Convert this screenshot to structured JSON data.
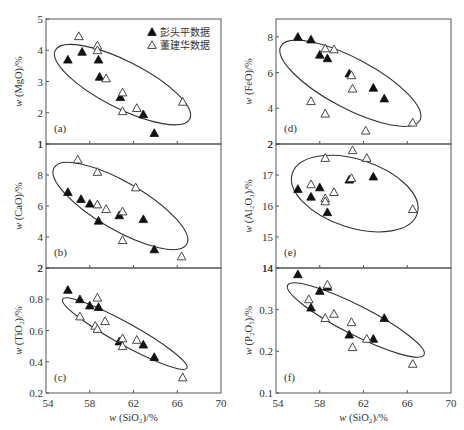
{
  "chart_data": [
    {
      "id": "a",
      "type": "scatter",
      "panel_label": "(a)",
      "ylabel": "w(MgO)/%",
      "xlabel": "",
      "xlim": [
        54,
        70
      ],
      "ylim": [
        1,
        5
      ],
      "yticks": [
        1,
        2,
        3,
        4,
        5
      ],
      "ytick_labels": [
        "1",
        "2",
        "3",
        "4",
        "5"
      ],
      "xticks": [
        54,
        58,
        62,
        66,
        70
      ],
      "show_xtick_labels": false,
      "legend": [
        {
          "name": "彭头平数据",
          "marker": "filled-triangle"
        },
        {
          "name": "董建华数据",
          "marker": "open-triangle"
        }
      ],
      "series": [
        {
          "name": "彭头平数据",
          "marker": "filled-triangle",
          "x": [
            56.0,
            57.3,
            58.9,
            58.8,
            60.8,
            62.9,
            63.9
          ],
          "y": [
            3.7,
            3.95,
            3.15,
            3.7,
            2.5,
            1.95,
            1.35
          ]
        },
        {
          "name": "董建华数据",
          "marker": "open-triangle",
          "x": [
            57.0,
            58.7,
            58.7,
            59.5,
            61.0,
            61.0,
            62.3,
            66.5
          ],
          "y": [
            4.45,
            4.15,
            4.0,
            3.1,
            2.65,
            2.05,
            2.15,
            2.35
          ]
        }
      ],
      "ellipse": {
        "cx": 61.0,
        "cy": 2.9,
        "rx": 6.9,
        "ry": 0.75,
        "angle": 27
      }
    },
    {
      "id": "b",
      "type": "scatter",
      "panel_label": "(b)",
      "ylabel": "w(CaO)/%",
      "xlabel": "",
      "xlim": [
        54,
        70
      ],
      "ylim": [
        2,
        10
      ],
      "yticks": [
        2,
        4,
        6,
        8,
        10
      ],
      "ytick_labels": [
        "2",
        "4",
        "6",
        "8",
        "1"
      ],
      "xticks": [
        54,
        58,
        62,
        66,
        70
      ],
      "show_xtick_labels": false,
      "series": [
        {
          "name": "彭头平数据",
          "marker": "filled-triangle",
          "x": [
            56.0,
            57.2,
            58.0,
            58.8,
            60.7,
            62.9,
            63.9
          ],
          "y": [
            6.9,
            6.45,
            6.15,
            5.05,
            5.4,
            5.15,
            3.2
          ]
        },
        {
          "name": "董建华数据",
          "marker": "open-triangle",
          "x": [
            56.9,
            58.7,
            58.7,
            59.5,
            61.0,
            61.0,
            62.2,
            66.4
          ],
          "y": [
            9.0,
            8.2,
            6.1,
            5.8,
            5.65,
            3.8,
            7.2,
            2.75
          ]
        }
      ],
      "ellipse": {
        "cx": 60.8,
        "cy": 6.0,
        "rx": 7.0,
        "ry": 1.55,
        "angle": 30
      }
    },
    {
      "id": "c",
      "type": "scatter",
      "panel_label": "(c)",
      "ylabel": "w(TiO₂)/%",
      "xlabel": "w(SiO₂)/%",
      "xlim": [
        54,
        70
      ],
      "ylim": [
        0.2,
        1.0
      ],
      "yticks": [
        0.2,
        0.4,
        0.6,
        0.8,
        1.0
      ],
      "ytick_labels": [
        "0.2",
        "0.4",
        "0.6",
        "0.8",
        "2"
      ],
      "xticks": [
        54,
        58,
        62,
        66,
        70
      ],
      "xtick_labels": [
        "54",
        "58",
        "62",
        "66",
        "70"
      ],
      "show_xtick_labels": true,
      "series": [
        {
          "name": "彭头平数据",
          "marker": "filled-triangle",
          "x": [
            56.0,
            57.1,
            58.0,
            58.8,
            60.7,
            62.9,
            63.9
          ],
          "y": [
            0.86,
            0.8,
            0.76,
            0.75,
            0.53,
            0.51,
            0.43
          ]
        },
        {
          "name": "董建华数据",
          "marker": "open-triangle",
          "x": [
            57.1,
            58.7,
            58.5,
            58.7,
            59.4,
            61.0,
            61.0,
            62.3,
            66.5
          ],
          "y": [
            0.69,
            0.81,
            0.63,
            0.61,
            0.66,
            0.55,
            0.5,
            0.54,
            0.3
          ]
        }
      ],
      "ellipse": {
        "cx": 61.2,
        "cy": 0.58,
        "rx": 6.5,
        "ry": 0.07,
        "angle": 29
      }
    },
    {
      "id": "d",
      "type": "scatter",
      "panel_label": "(d)",
      "ylabel": "w(FeO)/%",
      "xlabel": "",
      "xlim": [
        54,
        70
      ],
      "ylim": [
        2,
        9
      ],
      "yticks": [
        2,
        4,
        6,
        8
      ],
      "ytick_labels": [
        "2",
        "4",
        "6",
        "8"
      ],
      "xticks": [
        54,
        58,
        62,
        66,
        70
      ],
      "show_xtick_labels": false,
      "series": [
        {
          "name": "彭头平数据",
          "marker": "filled-triangle",
          "x": [
            56.0,
            57.2,
            58.0,
            58.7,
            60.7,
            62.9,
            63.9
          ],
          "y": [
            8.0,
            7.85,
            7.0,
            6.8,
            5.95,
            5.15,
            4.55
          ]
        },
        {
          "name": "董建华数据",
          "marker": "open-triangle",
          "x": [
            57.2,
            58.5,
            58.5,
            59.3,
            60.9,
            61.0,
            62.2,
            66.5
          ],
          "y": [
            4.4,
            3.7,
            7.35,
            7.3,
            5.85,
            5.1,
            2.75,
            3.2
          ]
        }
      ],
      "ellipse": {
        "cx": 60.8,
        "cy": 5.4,
        "rx": 7.2,
        "ry": 1.4,
        "angle": 28
      }
    },
    {
      "id": "e",
      "type": "scatter",
      "panel_label": "(e)",
      "ylabel": "w(Al₂O₃)/%",
      "xlabel": "",
      "xlim": [
        54,
        70
      ],
      "ylim": [
        14,
        18
      ],
      "yticks": [
        14,
        15,
        16,
        17,
        18
      ],
      "ytick_labels": [
        "14",
        "15",
        "16",
        "17",
        "2"
      ],
      "xticks": [
        54,
        58,
        62,
        66,
        70
      ],
      "show_xtick_labels": false,
      "series": [
        {
          "name": "彭头平数据",
          "marker": "filled-triangle",
          "x": [
            56.0,
            57.2,
            58.0,
            58.7,
            60.7,
            62.9
          ],
          "y": [
            16.55,
            16.3,
            16.6,
            15.8,
            16.85,
            16.95
          ]
        },
        {
          "name": "董建华数据",
          "marker": "open-triangle",
          "x": [
            57.2,
            58.5,
            58.5,
            58.5,
            59.3,
            60.9,
            61.0,
            62.3,
            66.5
          ],
          "y": [
            16.7,
            17.55,
            16.25,
            16.15,
            16.45,
            16.9,
            17.8,
            17.55,
            15.9
          ]
        }
      ],
      "ellipse": {
        "cx": 61.2,
        "cy": 16.4,
        "rx": 6.0,
        "ry": 1.1,
        "angle": 18
      }
    },
    {
      "id": "f",
      "type": "scatter",
      "panel_label": "(f)",
      "ylabel": "w(P₂O₅)/%",
      "xlabel": "w(SiO₂)/%",
      "xlim": [
        54,
        70
      ],
      "ylim": [
        0.1,
        0.4
      ],
      "yticks": [
        0.1,
        0.2,
        0.3,
        0.4
      ],
      "ytick_labels": [
        "0.1",
        "0.2",
        "0.3",
        "14"
      ],
      "xticks": [
        54,
        58,
        62,
        66,
        70
      ],
      "xtick_labels": [
        "54",
        "58",
        "62",
        "66",
        "70"
      ],
      "show_xtick_labels": true,
      "series": [
        {
          "name": "彭头平数据",
          "marker": "filled-triangle",
          "x": [
            56.0,
            57.2,
            58.0,
            58.7,
            60.7,
            62.9,
            63.9
          ],
          "y": [
            0.385,
            0.305,
            0.345,
            0.355,
            0.24,
            0.23,
            0.28
          ]
        },
        {
          "name": "董建华数据",
          "marker": "open-triangle",
          "x": [
            57.0,
            58.5,
            58.7,
            59.3,
            60.9,
            61.0,
            62.3,
            66.5
          ],
          "y": [
            0.325,
            0.28,
            0.36,
            0.29,
            0.27,
            0.21,
            0.23,
            0.17
          ]
        }
      ],
      "ellipse": {
        "cx": 61.3,
        "cy": 0.275,
        "rx": 7.0,
        "ry": 0.035,
        "angle": 27
      }
    }
  ],
  "legend": {
    "items": [
      {
        "label": "彭头平数据",
        "marker": "filled-triangle"
      },
      {
        "label": "董建华数据",
        "marker": "open-triangle"
      }
    ]
  },
  "layout": {
    "columns": [
      {
        "x0": 46,
        "x1": 221,
        "panels": [
          "a",
          "b",
          "c"
        ]
      },
      {
        "x0": 276,
        "x1": 451,
        "panels": [
          "d",
          "e",
          "f"
        ]
      }
    ],
    "rows": [
      {
        "y0": 19,
        "y1": 144
      },
      {
        "y0": 144,
        "y1": 268
      },
      {
        "y0": 268,
        "y1": 393
      }
    ]
  },
  "colors": {
    "frame": "#555555",
    "filled_marker": "#111111",
    "open_marker_stroke": "#333333",
    "ellipse": "#333333",
    "text": "#333333"
  }
}
